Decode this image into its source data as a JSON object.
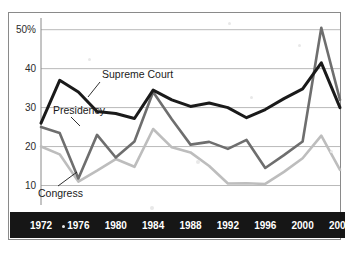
{
  "chart_data": {
    "type": "line",
    "title": "",
    "xlabel": "",
    "ylabel": "",
    "x": [
      1972,
      1974,
      1976,
      1978,
      1980,
      1982,
      1984,
      1986,
      1988,
      1990,
      1992,
      1994,
      1996,
      1998,
      2000,
      2002,
      2004
    ],
    "xlim": [
      1972,
      2004
    ],
    "ylim": [
      5,
      53
    ],
    "grid": true,
    "grid_axis": "y",
    "legend": "inline-labels",
    "yticks": [
      10,
      20,
      30,
      40,
      50
    ],
    "ytick_labels": [
      "10",
      "20",
      "30",
      "40",
      "50%"
    ],
    "xticks": [
      1972,
      1976,
      1980,
      1984,
      1988,
      1992,
      1996,
      2000,
      2004
    ],
    "xtick_labels": [
      "1972",
      "1976",
      "1980",
      "1984",
      "1988",
      "1992",
      "1996",
      "2000",
      "2004"
    ],
    "series": [
      {
        "name": "Supreme Court",
        "color": "#1a1a1a",
        "values": [
          26.0,
          37.0,
          34.0,
          29.0,
          28.5,
          27.2,
          34.5,
          32.0,
          30.3,
          31.2,
          30.0,
          27.4,
          29.5,
          32.3,
          34.8,
          41.5,
          30.0
        ]
      },
      {
        "name": "Presidency",
        "color": "#6e6e6e",
        "values": [
          25.0,
          23.5,
          11.8,
          23.0,
          17.2,
          21.3,
          34.0,
          27.0,
          20.5,
          21.2,
          19.4,
          21.7,
          14.5,
          17.8,
          21.3,
          50.5,
          32.0
        ]
      },
      {
        "name": "Congress",
        "color": "#bdbdbd",
        "values": [
          20.0,
          18.0,
          11.0,
          13.8,
          16.8,
          14.8,
          24.5,
          19.8,
          18.5,
          15.0,
          10.5,
          10.6,
          10.4,
          13.5,
          17.0,
          22.8,
          14.0
        ]
      }
    ],
    "annotations": [
      {
        "label": "Supreme Court",
        "series": "Supreme Court"
      },
      {
        "label": "Presidency",
        "series": "Presidency"
      },
      {
        "label": "Congress",
        "series": "Congress"
      }
    ],
    "axis_band_color": "#161616"
  }
}
